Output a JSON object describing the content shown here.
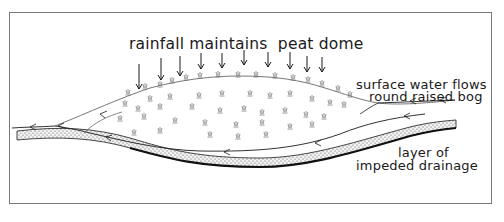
{
  "diagram": {
    "labels": {
      "rainfall": "rainfall maintains  peat dome",
      "surface_line1": "surface water flows",
      "surface_line2": "round raised bog",
      "layer_line1": "layer of",
      "layer_line2": "impeded drainage"
    },
    "rain_arrow_count": 10,
    "colors": {
      "ink": "#1a1a1a",
      "frame": "#7a7a7a",
      "background": "#ffffff",
      "vegetation": "#6a6a6a"
    }
  }
}
